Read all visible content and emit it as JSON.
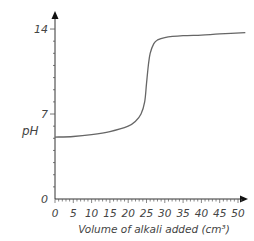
{
  "chart_data": {
    "type": "line",
    "title": "",
    "xlabel": "Volume of alkali added (cm³)",
    "ylabel": "pH",
    "xlim": [
      0,
      52
    ],
    "ylim": [
      0,
      14
    ],
    "x_ticks": [
      "0",
      "5",
      "10",
      "15",
      "20",
      "25",
      "30",
      "35",
      "40",
      "45",
      "50"
    ],
    "y_ticks": [
      "0",
      "7",
      "14"
    ],
    "grid": false,
    "legend": null,
    "series": [
      {
        "name": "titration curve",
        "x": [
          0,
          5,
          10,
          15,
          20,
          22,
          23.5,
          24.5,
          25,
          25.5,
          26,
          27,
          28,
          30,
          35,
          40,
          45,
          52
        ],
        "y": [
          5.1,
          5.15,
          5.3,
          5.55,
          6.0,
          6.4,
          7.0,
          8.0,
          9.5,
          11.0,
          12.0,
          12.8,
          13.1,
          13.3,
          13.45,
          13.5,
          13.6,
          13.7
        ]
      }
    ],
    "colors": {
      "axis": "#333333",
      "curve": "#666666",
      "text": "#444444"
    }
  }
}
